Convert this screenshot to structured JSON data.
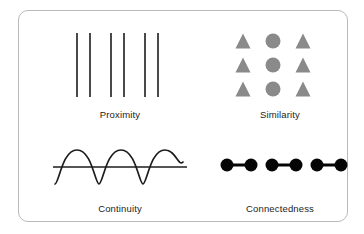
{
  "figure": {
    "background_color": "#ffffff",
    "card": {
      "border_color": "#b9b9b9",
      "corner_radius": 10,
      "fill": "#ffffff"
    }
  },
  "colors": {
    "stroke_dark": "#1c1c1c",
    "shape_gray": "#8a8a8a",
    "dot_black": "#050505",
    "label_text": "#1c1c1c",
    "card_border": "#b9b9b9"
  },
  "panels": [
    {
      "key": "proximity",
      "label": "Proximity",
      "icon": "vertical-lines-icon",
      "description": "Six vertical lines arranged in three closely spaced pairs",
      "lines": {
        "count": 6,
        "pairs": 3,
        "color": "#1c1c1c",
        "stroke_width": 1.6,
        "y_top": 6,
        "y_bottom": 70,
        "x_positions": [
          32,
          45,
          66,
          79,
          100,
          113
        ]
      }
    },
    {
      "key": "similarity",
      "label": "Similarity",
      "icon": "shape-grid-icon",
      "description": "Three-by-three grid where outer columns are triangles and the middle column is circles",
      "grid": {
        "rows": 3,
        "cols": 3,
        "color": "#8a8a8a",
        "row_y": [
          14,
          38,
          62
        ],
        "col_x": [
          38,
          68,
          98
        ],
        "shapes": [
          [
            "triangle",
            "circle",
            "triangle"
          ],
          [
            "triangle",
            "circle",
            "triangle"
          ],
          [
            "triangle",
            "circle",
            "triangle"
          ]
        ],
        "triangle_size": 15,
        "circle_radius": 7.5
      }
    },
    {
      "key": "continuity",
      "label": "Continuity",
      "icon": "wave-line-icon",
      "description": "A sine wave crossing a straight horizontal line",
      "wave": {
        "cycles": 3,
        "color": "#1c1c1c",
        "stroke_width": 1.7,
        "amplitude": 17,
        "baseline_y": 30,
        "x_start": 10,
        "x_end": 140
      },
      "straight_line": {
        "color": "#1c1c1c",
        "stroke_width": 1.7,
        "y": 30,
        "x_start": 8,
        "x_end": 142
      }
    },
    {
      "key": "connectedness",
      "label": "Connectedness",
      "icon": "linked-dots-icon",
      "description": "Six filled dots joined by short connectors into three linked pairs",
      "dots": {
        "count": 6,
        "pairs": 3,
        "color": "#050505",
        "radius": 6.5,
        "center_y": 28,
        "x_positions": [
          22,
          46,
          67,
          91,
          112,
          136
        ],
        "connector_width": 3,
        "connectors": [
          [
            22,
            46
          ],
          [
            67,
            91
          ],
          [
            112,
            136
          ]
        ]
      }
    }
  ]
}
